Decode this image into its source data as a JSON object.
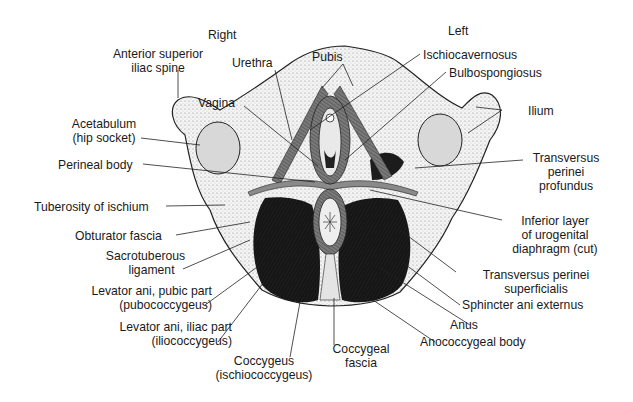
{
  "figure": {
    "orientation": {
      "right": "Right",
      "left": "Left"
    },
    "labels": {
      "asis": [
        "Anterior superior",
        "iliac spine"
      ],
      "urethra": "Urethra",
      "pubis": "Pubis",
      "ischiocavernosus": "Ischiocavernosus",
      "bulbospongiosus": "Bulbospongiosus",
      "vagina": "Vagina",
      "ilium": "Ilium",
      "acetabulum": [
        "Acetabulum",
        "(hip socket)"
      ],
      "perineal_body": "Perineal body",
      "transversus_profundus": [
        "Transversus",
        "perinei",
        "profundus"
      ],
      "tuberosity": "Tuberosity of ischium",
      "inferior_layer": [
        "Inferior layer",
        "of urogenital",
        "diaphragm (cut)"
      ],
      "obturator_fascia": "Obturator fascia",
      "sacrotuberous": [
        "Sacrotuberous",
        "ligament"
      ],
      "transversus_superficialis": [
        "Transversus perinei",
        "superficialis"
      ],
      "levator_pubic": [
        "Levator ani, pubic part",
        "(pubococcygeus)"
      ],
      "sphincter": "Sphincter ani externus",
      "anus": "Anus",
      "levator_iliac": [
        "Levator ani, iliac part",
        "(iliococcygeus)"
      ],
      "anococcygeal": "Anococcygeal body",
      "coccygeus": [
        "Coccygeus",
        "(ischiococcygeus)"
      ],
      "coccygeal_fascia": [
        "Coccygeal",
        "fascia"
      ]
    },
    "colors": {
      "ink": "#1a1a1a",
      "bone": "#f2f2f2",
      "muscle_dark": "#141414",
      "background": "#ffffff"
    }
  }
}
